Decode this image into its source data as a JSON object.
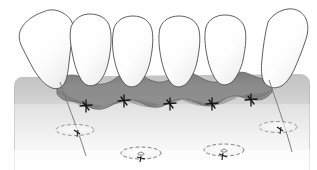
{
  "figure": {
    "title": "Dental implant flap closure with interrupted sutures",
    "view": "frontal",
    "canvas": {
      "width": 317,
      "height": 170,
      "background": "#ffffff"
    }
  },
  "palette": {
    "background": "#ffffff",
    "tooth_fill": "#fdfdfd",
    "tooth_fill_shadow": "#e8e8e8",
    "tooth_outline": "#4a4a4a",
    "gingiva_flap_fill": "#8a8a8a",
    "gingiva_flap_dark": "#7b7b7b",
    "gingiva_flap_outline": "#5f5f5f",
    "bone_fill_top": "#c9c9c9",
    "bone_fill_bottom": "#ffffff",
    "bone_outline": "#9c9c9c",
    "suture_thread": "#6e6e6e",
    "suture_knot": "#1c1c1c",
    "cover_screw_outline": "#6b6b6b",
    "cover_screw_fill": "#f2f2f2"
  },
  "structures": {
    "teeth": {
      "label": "Teeth (maxillary anterior crowns)",
      "count": 6,
      "items": [
        {
          "id": "tooth-1",
          "label": "Tooth 1 (tilted, distal-left)",
          "cx": 36,
          "tilt": "mesially inclined",
          "crown_top_y": 11
        },
        {
          "id": "tooth-2",
          "label": "Tooth 2",
          "cx": 84,
          "tilt": "upright",
          "crown_top_y": 15
        },
        {
          "id": "tooth-3",
          "label": "Tooth 3",
          "cx": 130,
          "tilt": "upright",
          "crown_top_y": 17
        },
        {
          "id": "tooth-4",
          "label": "Tooth 4",
          "cx": 177,
          "tilt": "upright",
          "crown_top_y": 17
        },
        {
          "id": "tooth-5",
          "label": "Tooth 5",
          "cx": 224,
          "tilt": "upright",
          "crown_top_y": 16
        },
        {
          "id": "tooth-6",
          "label": "Tooth 6 (tilted, distal-right)",
          "cx": 281,
          "tilt": "distally inclined",
          "crown_top_y": 10
        }
      ]
    },
    "gingival_flap": {
      "label": "Reflected and repositioned gingival flap",
      "fill": "#8a8a8a",
      "span_x": [
        55,
        272
      ],
      "top_y": 72,
      "bottom_y": 110,
      "edge": "scalloped-wavy"
    },
    "alveolar_bone": {
      "label": "Alveolar bone / underlying tissue (faded)",
      "gradient_from": "#c9c9c9",
      "gradient_to": "#ffffff",
      "span_x": [
        14,
        310
      ],
      "top_y": 74,
      "bottom_y": 170
    },
    "sutures": {
      "label": "Interrupted sutures along flap margin",
      "count": 5,
      "knots": [
        {
          "id": "suture-1",
          "x": 86,
          "y": 106
        },
        {
          "id": "suture-2",
          "x": 124,
          "y": 101
        },
        {
          "id": "suture-3",
          "x": 170,
          "y": 104
        },
        {
          "id": "suture-4",
          "x": 212,
          "y": 104
        },
        {
          "id": "suture-5",
          "x": 251,
          "y": 100
        }
      ]
    },
    "suture_threads": {
      "label": "Free suture thread tails",
      "items": [
        {
          "id": "thread-left",
          "x1": 62,
          "y1": 84,
          "x2": 84,
          "y2": 155
        },
        {
          "id": "thread-right",
          "x1": 268,
          "y1": 82,
          "x2": 290,
          "y2": 150
        }
      ]
    },
    "cover_screws": {
      "label": "Submerged implant cover screws (dashed ellipses)",
      "count": 4,
      "items": [
        {
          "id": "cover-screw-1",
          "cx": 75,
          "cy": 130,
          "rx": 19,
          "ry": 5.5,
          "has_knot": true
        },
        {
          "id": "cover-screw-2",
          "cx": 141,
          "cy": 153,
          "rx": 20,
          "ry": 6,
          "has_knot": true
        },
        {
          "id": "cover-screw-3",
          "cx": 224,
          "cy": 150,
          "rx": 20,
          "ry": 6,
          "has_knot": true
        },
        {
          "id": "cover-screw-4",
          "cx": 278,
          "cy": 127,
          "rx": 19,
          "ry": 5.5,
          "has_knot": true
        }
      ]
    }
  }
}
